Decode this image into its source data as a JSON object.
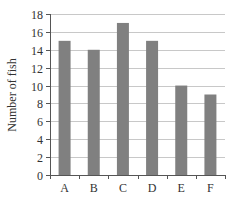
{
  "chart_data": {
    "type": "bar",
    "title": "",
    "xlabel": "",
    "ylabel": "Number of fish",
    "categories": [
      "A",
      "B",
      "C",
      "D",
      "E",
      "F"
    ],
    "values": [
      15,
      14,
      17,
      15,
      10,
      9
    ],
    "ylim": [
      0,
      18
    ],
    "yticks": [
      0,
      2,
      4,
      6,
      8,
      10,
      12,
      14,
      16,
      18
    ],
    "grid": true,
    "legend": null,
    "colors": {
      "bar": "#808080",
      "grid": "#c8c8c8",
      "axis": "#555555"
    }
  }
}
